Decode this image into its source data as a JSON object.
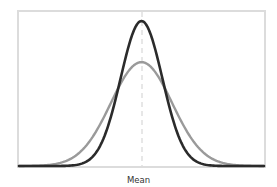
{
  "chart_data": {
    "type": "line",
    "title": "",
    "xlabel": "Mean",
    "ylabel": "",
    "xlim": [
      -4,
      4
    ],
    "ylim": [
      0,
      0.6
    ],
    "grid": false,
    "legend": null,
    "mean_marker": {
      "x": 0,
      "style": "dashed",
      "color": "#d8d8d8"
    },
    "series": [
      {
        "name": "wide distribution",
        "kind": "normal",
        "mean": 0,
        "sd": 1.0,
        "peak_density": 0.399,
        "color": "#9a9a9a",
        "x": [
          -4,
          -3,
          -2,
          -1.5,
          -1,
          -0.5,
          0,
          0.5,
          1,
          1.5,
          2,
          3,
          4
        ],
        "values": [
          0.0001,
          0.0044,
          0.054,
          0.1295,
          0.242,
          0.352,
          0.399,
          0.352,
          0.242,
          0.1295,
          0.054,
          0.0044,
          0.0001
        ]
      },
      {
        "name": "narrow distribution",
        "kind": "normal",
        "mean": 0,
        "sd": 0.68,
        "peak_density": 0.557,
        "color": "#2b2b2b",
        "x": [
          -4,
          -3,
          -2,
          -1.5,
          -1,
          -0.5,
          0,
          0.5,
          1,
          1.5,
          2,
          3,
          4
        ],
        "values": [
          0.0,
          4e-05,
          0.0075,
          0.05,
          0.19,
          0.425,
          0.557,
          0.425,
          0.19,
          0.05,
          0.0075,
          4e-05,
          0.0
        ]
      }
    ]
  },
  "labels": {
    "x_axis": "Mean"
  }
}
